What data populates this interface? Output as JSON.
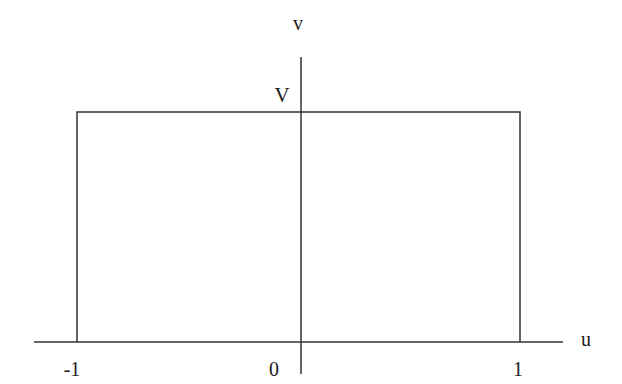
{
  "diagram": {
    "axes": {
      "x_label": "u",
      "y_label": "v",
      "x_ticks": [
        "-1",
        "0",
        "1"
      ],
      "y_ticks": [
        "V"
      ]
    },
    "shape": {
      "type": "rectangular pulse",
      "u_range": [
        -1,
        1
      ],
      "height_label": "V"
    },
    "colors": {
      "line": "#333333",
      "background": "#ffffff"
    }
  }
}
